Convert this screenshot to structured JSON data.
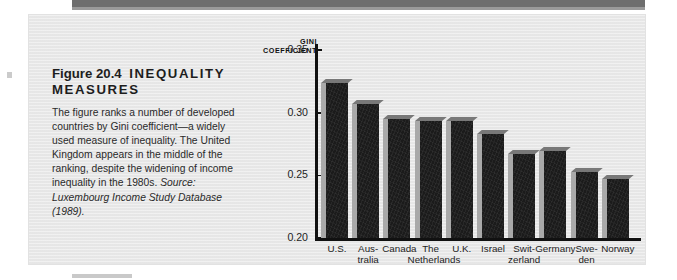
{
  "figure": {
    "number_label": "Figure 20.4",
    "title": "INEQUALITY MEASURES",
    "body": "The figure ranks a number of developed countries by Gini coefficient—a widely used measure of inequality. The United Kingdom appears in the middle of the ranking, despite the widening of income inequality in the 1980s. ",
    "source_label": "Source:",
    "source_text": " Luxembourg Income Study Database (1989)."
  },
  "chart_data": {
    "type": "bar",
    "title": "",
    "axis_title": "GINI\nCOEFFICIENT",
    "xlabel": "",
    "ylabel": "GINI COEFFICIENT",
    "ylim": [
      0.2,
      0.355
    ],
    "yticks": [
      "0.20",
      "0.25",
      "0.30",
      "0.35"
    ],
    "ytick_values": [
      0.2,
      0.25,
      0.3,
      0.35
    ],
    "grid": false,
    "legend": "none",
    "categories": [
      "U.S.",
      "Aus-\ntralia",
      "Canada",
      "The\nNetherlands",
      "U.K.",
      "Israel",
      "Swit-\nzerland",
      "Germany",
      "Swe-\nden",
      "Norway"
    ],
    "values": [
      0.327,
      0.31,
      0.298,
      0.297,
      0.297,
      0.286,
      "0.270",
      0.273,
      0.256,
      0.25
    ],
    "bar_values": [
      0.327,
      0.31,
      0.298,
      0.297,
      0.297,
      0.286,
      0.27,
      0.273,
      0.256,
      0.25
    ],
    "colors": {
      "bar": "#1b1b1b",
      "bar_side": "#a9a9a9",
      "axis": "#111111",
      "panel": "#e9e9e9"
    }
  }
}
